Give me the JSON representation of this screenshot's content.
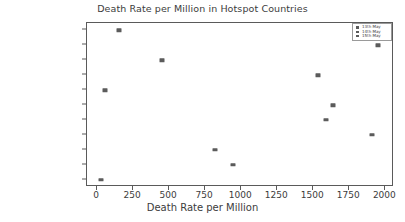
{
  "chart_data": {
    "type": "scatter",
    "title": "Death Rate per Million in Hotspot Countries",
    "xlabel": "Death Rate per Million",
    "ylabel": "",
    "xlim": [
      -70,
      2060
    ],
    "xticks": [
      0,
      250,
      500,
      750,
      1000,
      1250,
      1500,
      1750,
      2000
    ],
    "xticklabels": [
      "0",
      "250",
      "500",
      "750",
      "1000",
      "1250",
      "1500",
      "1750",
      "2000"
    ],
    "categories": [
      "India",
      "Unired Kingdom",
      "Turkey",
      "France",
      "South Korea",
      "United States",
      "Spain",
      "Italy",
      "Iran",
      "Germany",
      "China"
    ],
    "values": [
      150,
      1950,
      450,
      1530,
      55,
      1640,
      1585,
      1905,
      820,
      945,
      28
    ],
    "grid": false,
    "legend_position": "upper right",
    "legend": [
      {
        "label": "13th May",
        "marker": "square",
        "color": "#5b5b5b"
      },
      {
        "label": "14th May",
        "marker": "square",
        "color": "#5b5b5b"
      },
      {
        "label": "15th May",
        "marker": "square",
        "color": "#5b5b5b"
      }
    ],
    "marker_color": "#5b5b5b",
    "axis_color": "#5a5a5a",
    "text_color": "#3c3c3c",
    "background": "#ffffff"
  }
}
